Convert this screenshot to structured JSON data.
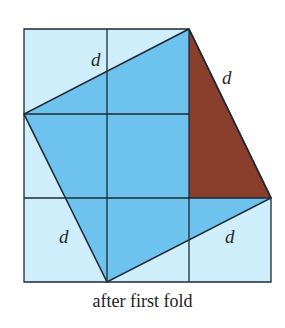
{
  "figure": {
    "caption": "after first fold",
    "labels": {
      "top_left": "d",
      "top_right": "d",
      "bottom_left": "d",
      "bottom_right": "d"
    },
    "colors": {
      "light_square": "#cdeefa",
      "folded_quad": "#6ec3ee",
      "brown_triangle": "#8a3e2c",
      "lines": "#1e2a33"
    },
    "grid": {
      "rows": 3,
      "cols": 3,
      "missing_cells": [
        "top-right",
        "middle-right"
      ]
    }
  }
}
